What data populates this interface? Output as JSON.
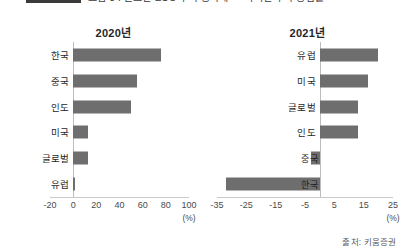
{
  "header": {
    "clipped_title_text": "그림 3 : 글로벌 ESG 투자 증가세 — 지역별 투자 증감률",
    "legend_swatch_color": "#3a3a3a"
  },
  "footer": {
    "source": "출처: 키움증권"
  },
  "style": {
    "bar_color": "#6e6e6e",
    "axis_color": "#c9c9c9",
    "text_color": "#1f1f1f"
  },
  "chart_data": [
    {
      "type": "bar",
      "orientation": "horizontal",
      "title": "2020년",
      "xlabel": "(%)",
      "ylabel": "",
      "categories": [
        "한국",
        "중국",
        "인도",
        "미국",
        "글로벌",
        "유럽"
      ],
      "values": [
        76,
        55,
        50,
        13,
        13,
        2
      ],
      "xlim": [
        -20,
        100
      ],
      "xticks": [
        -20,
        0,
        20,
        40,
        60,
        80,
        100
      ],
      "grid": false,
      "legend": false,
      "label_placement": [
        "outside",
        "outside",
        "outside",
        "outside",
        "outside",
        "outside"
      ]
    },
    {
      "type": "bar",
      "orientation": "horizontal",
      "title": "2021년",
      "xlabel": "(%)",
      "ylabel": "",
      "categories": [
        "유럽",
        "미국",
        "글로벌",
        "인도",
        "중국",
        "한국"
      ],
      "values": [
        20,
        16.5,
        13,
        13,
        -3,
        -32
      ],
      "xlim": [
        -35,
        25
      ],
      "xticks": [
        -35,
        -25,
        -15,
        -5,
        5,
        15,
        25
      ],
      "grid": false,
      "legend": false,
      "label_placement": [
        "outside",
        "outside",
        "outside",
        "outside",
        "inside",
        "inside"
      ]
    }
  ]
}
